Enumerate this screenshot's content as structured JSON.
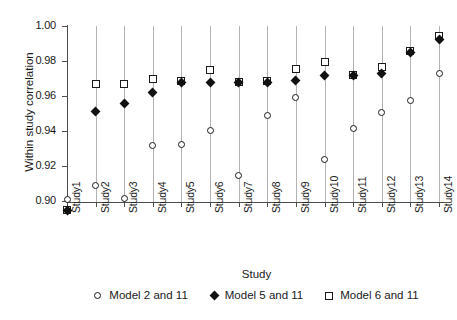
{
  "chart_data": {
    "type": "scatter",
    "title": "",
    "xlabel": "Study",
    "ylabel": "Within study correlation",
    "grid": "vertical",
    "legend_position": "bottom",
    "ylim": [
      0.89,
      1.005
    ],
    "yticks": [
      "0.90",
      "0.92",
      "0.94",
      "0.96",
      "0.98",
      "1.00"
    ],
    "ytick_values": [
      0.9,
      0.92,
      0.94,
      0.96,
      0.98,
      1.0
    ],
    "categories": [
      "Study1",
      "Study2",
      "Study3",
      "Study4",
      "Study5",
      "Study6",
      "Study7",
      "Study8",
      "Study9",
      "Study10",
      "Study11",
      "Study12",
      "Study13",
      "Study14"
    ],
    "series": [
      {
        "name": "Model 2 and 11",
        "marker": "open-circle",
        "color": "#1a1a1a",
        "values": [
          0.901,
          0.909,
          0.9015,
          0.932,
          0.9325,
          0.9405,
          0.9145,
          0.949,
          0.959,
          0.924,
          0.9415,
          0.9505,
          0.9575,
          0.973
        ]
      },
      {
        "name": "Model 5 and 11",
        "marker": "filled-diamond",
        "color": "#111111",
        "values": [
          0.8945,
          0.951,
          0.956,
          0.962,
          0.9675,
          0.968,
          0.9675,
          0.9675,
          0.969,
          0.9715,
          0.972,
          0.973,
          0.985,
          0.9925
        ]
      },
      {
        "name": "Model 6 and 11",
        "marker": "open-square",
        "color": "#1a1a1a",
        "values": [
          0.8948,
          0.9668,
          0.9668,
          0.9695,
          0.9685,
          0.975,
          0.968,
          0.9685,
          0.9755,
          0.9795,
          0.972,
          0.9765,
          0.9855,
          0.9945
        ]
      }
    ]
  },
  "legend": {
    "items": [
      {
        "label": "Model 2 and 11",
        "marker": "open-circle"
      },
      {
        "label": "Model 5 and 11",
        "marker": "filled-diamond"
      },
      {
        "label": "Model 6 and 11",
        "marker": "open-square"
      }
    ]
  }
}
